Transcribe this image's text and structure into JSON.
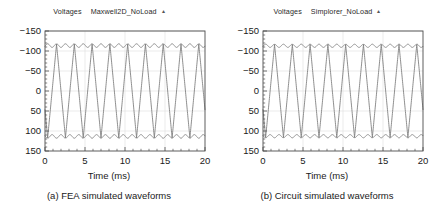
{
  "figure": {
    "background": "#ffffff",
    "axis_color": "#4d4d4d",
    "grid_color": "#e3e3e3",
    "trace_color": "#7a7a7a"
  },
  "panels": [
    {
      "id": "panel-a",
      "legend": {
        "title": "Voltages",
        "series": "Maxwell2D_NoLoad",
        "marker": "▴"
      },
      "caption": "(a) FEA simulated waveforms",
      "xlabel": "Time (ms)",
      "ylabel": "",
      "xticks": [
        "0",
        "5",
        "10",
        "15",
        "20"
      ],
      "yticks": [
        "150",
        "100",
        "50",
        "0",
        "−50",
        "−100",
        "−150"
      ]
    },
    {
      "id": "panel-b",
      "legend": {
        "title": "Voltages",
        "series": "Simplorer_NoLoad",
        "marker": "▴"
      },
      "caption": "(b) Circuit simulated waveforms",
      "xlabel": "Time (ms)",
      "ylabel": "",
      "xticks": [
        "0",
        "5",
        "10",
        "15",
        "20"
      ],
      "yticks": [
        "150",
        "100",
        "50",
        "0",
        "−50",
        "−100",
        "−150"
      ]
    }
  ],
  "chart_data": [
    {
      "type": "line",
      "title": "Voltages Maxwell2D_NoLoad",
      "subtitle": "(a) FEA simulated waveforms",
      "xlabel": "Time (ms)",
      "ylabel": "",
      "xlim": [
        0,
        20
      ],
      "ylim": [
        -150,
        150
      ],
      "xticks": [
        0,
        5,
        10,
        15,
        20
      ],
      "yticks": [
        -150,
        -100,
        -50,
        0,
        50,
        100,
        150
      ],
      "minor_ticks_per_major": 5,
      "grid": true,
      "legend_position": "above-right",
      "waveform": {
        "shape": "trapezoidal-3phase-back-emf",
        "amplitude": 118,
        "period_ms": 6.667,
        "frequency_hz": 150,
        "phase_offsets_deg": [
          0,
          120,
          240
        ],
        "initial_phase_deg": -48,
        "flat_top_ripple": true,
        "ripple_depth": 9
      },
      "series": [
        {
          "name": "Phase A",
          "color": "#7a7a7a"
        },
        {
          "name": "Phase B",
          "color": "#7a7a7a"
        },
        {
          "name": "Phase C",
          "color": "#7a7a7a"
        }
      ]
    },
    {
      "type": "line",
      "title": "Voltages Simplorer_NoLoad",
      "subtitle": "(b) Circuit simulated waveforms",
      "xlabel": "Time (ms)",
      "ylabel": "",
      "xlim": [
        0,
        20
      ],
      "ylim": [
        -150,
        150
      ],
      "xticks": [
        0,
        5,
        10,
        15,
        20
      ],
      "yticks": [
        -150,
        -100,
        -50,
        0,
        50,
        100,
        150
      ],
      "minor_ticks_per_major": 5,
      "grid": true,
      "legend_position": "above-right",
      "waveform": {
        "shape": "trapezoidal-3phase-back-emf",
        "amplitude": 117,
        "period_ms": 6.667,
        "frequency_hz": 150,
        "phase_offsets_deg": [
          0,
          120,
          240
        ],
        "initial_phase_deg": -48,
        "flat_top_ripple": true,
        "ripple_depth": 8
      },
      "series": [
        {
          "name": "Phase A",
          "color": "#7a7a7a"
        },
        {
          "name": "Phase B",
          "color": "#7a7a7a"
        },
        {
          "name": "Phase C",
          "color": "#7a7a7a"
        }
      ]
    }
  ]
}
